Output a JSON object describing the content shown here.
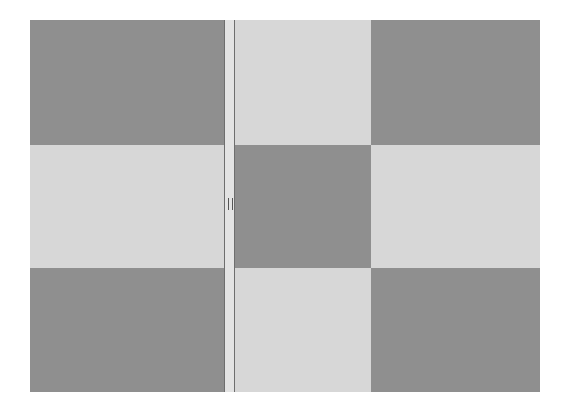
{
  "layout": {
    "columns": [
      "left",
      "center",
      "right"
    ],
    "rows": [
      "top",
      "middle",
      "bottom"
    ]
  },
  "cells": [
    {
      "row": "top",
      "col": "left",
      "shade": "dark"
    },
    {
      "row": "top",
      "col": "center",
      "shade": "light"
    },
    {
      "row": "top",
      "col": "right",
      "shade": "dark"
    },
    {
      "row": "middle",
      "col": "left",
      "shade": "light"
    },
    {
      "row": "middle",
      "col": "center",
      "shade": "dark"
    },
    {
      "row": "middle",
      "col": "right",
      "shade": "light"
    },
    {
      "row": "bottom",
      "col": "left",
      "shade": "dark"
    },
    {
      "row": "bottom",
      "col": "center",
      "shade": "light"
    },
    {
      "row": "bottom",
      "col": "right",
      "shade": "dark"
    }
  ],
  "splitter": {
    "orientation": "vertical",
    "icon": "grip-handle-icon"
  },
  "colors": {
    "dark": "#8f8f8f",
    "light": "#d7d7d7",
    "splitter": "#e3e3e3"
  }
}
